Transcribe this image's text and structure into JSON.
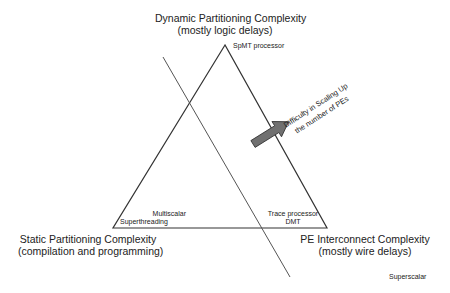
{
  "vertices": {
    "top": {
      "title": "Dynamic Partitioning Complexity",
      "subtitle": "(mostly logic delays)",
      "example": "SpMT processor"
    },
    "left": {
      "title": "Static Partitioning Complexity",
      "subtitle": "(compilation and programming)",
      "examples": [
        "Multiscalar",
        "Superthreading"
      ]
    },
    "right": {
      "title": "PE Interconnect Complexity",
      "subtitle": "(mostly wire delays)",
      "examples": [
        "Trace processor",
        "DMT"
      ]
    }
  },
  "outside_label": "Superscalar",
  "arrow": {
    "line1": "Difficulty in Scaling Up",
    "line2": "the number of PEs",
    "color": "#707070"
  },
  "colors": {
    "line": "#333333",
    "divider": "#555555"
  }
}
